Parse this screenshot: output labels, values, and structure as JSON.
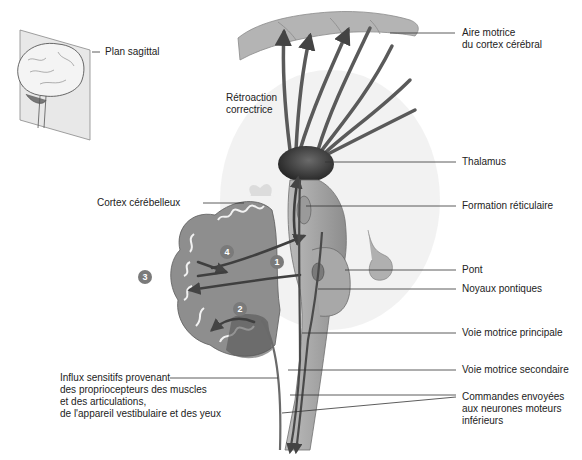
{
  "diagram": {
    "inset": {
      "label": "Plan sagittal"
    },
    "labels": {
      "aire_motrice_1": "Aire motrice",
      "aire_motrice_2": "du cortex cérébral",
      "retroaction_1": "Rétroaction",
      "retroaction_2": "correctrice",
      "thalamus": "Thalamus",
      "cortex_cerebelleux": "Cortex cérébelleux",
      "formation_reticulaire": "Formation réticulaire",
      "pont": "Pont",
      "noyaux_pontiques": "Noyaux pontiques",
      "voie_principale": "Voie motrice principale",
      "voie_secondaire": "Voie motrice secondaire",
      "influx_1": "Influx sensitifs provenant",
      "influx_2": "des propriocepteurs des muscles",
      "influx_3": "et des articulations,",
      "influx_4": "de l'appareil vestibulaire et des yeux",
      "commandes_1": "Commandes envoyées",
      "commandes_2": "aux neurones moteurs",
      "commandes_3": "inférieurs"
    },
    "markers": [
      "1",
      "2",
      "3",
      "4"
    ],
    "colors": {
      "leader_line": "#333333",
      "pathway": "#555555",
      "tissue": "#9a9a9a",
      "marker": "#7a7a7a"
    }
  }
}
